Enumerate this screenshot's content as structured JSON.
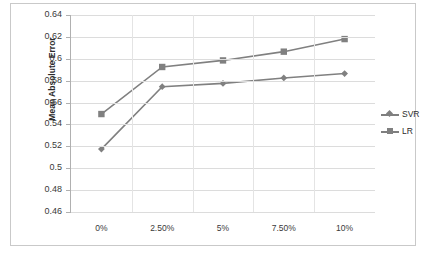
{
  "chart_data": {
    "type": "line",
    "title": "",
    "xlabel": "",
    "ylabel": "Mean Absolute Error",
    "categories": [
      "0%",
      "2.50%",
      "5%",
      "7.50%",
      "10%"
    ],
    "series": [
      {
        "name": "SVR",
        "marker": "diamond",
        "color": "#808080",
        "values": [
          0.5175,
          0.5745,
          0.5775,
          0.5825,
          0.5865
        ]
      },
      {
        "name": "LR",
        "marker": "square",
        "color": "#808080",
        "values": [
          0.5495,
          0.5925,
          0.5985,
          0.6065,
          0.618
        ]
      }
    ],
    "ylim": [
      0.46,
      0.64
    ],
    "ytick_labels": [
      "0.64",
      "0.62",
      "0.6",
      "0.58",
      "0.56",
      "0.54",
      "0.52",
      "0.5",
      "0.48",
      "0.46"
    ],
    "ytick_values": [
      0.64,
      0.62,
      0.6,
      0.58,
      0.56,
      0.54,
      0.52,
      0.5,
      0.48,
      0.46
    ],
    "grid": true,
    "legend_position": "right",
    "legend": [
      "SVR",
      "LR"
    ]
  },
  "colors": {
    "series": "#808080",
    "gridline": "#dcdcdc",
    "axis": "#b0b0b0",
    "border": "#c9c9c9",
    "text": "#3a3a3a",
    "background": "#ffffff"
  }
}
